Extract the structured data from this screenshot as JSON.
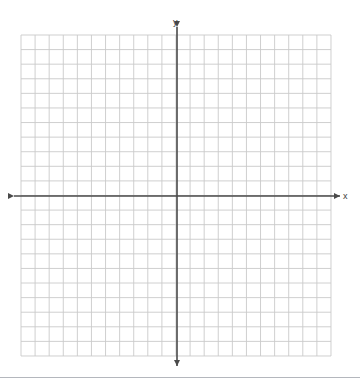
{
  "figure": {
    "title": "",
    "type": "blank-coordinate-grid"
  },
  "labels": {
    "y_axis": "y",
    "x_axis": "x"
  },
  "colors": {
    "background": "#ffffff",
    "gridline": "#c9c9c9",
    "gridline_minor": "#dcdcdc",
    "axis": "#4a4a4a",
    "label_text": "#3c3c3c",
    "bottom_rule": "#b4b7bd"
  },
  "chart_data": {
    "type": "scatter",
    "title": "",
    "xlabel": "x",
    "ylabel": "y",
    "grid": true,
    "legend": null,
    "series": [],
    "x": [],
    "values": [],
    "xlim": [
      -11,
      11
    ],
    "ylim": [
      -11,
      11
    ],
    "x_major_step": 1,
    "y_major_step": 1,
    "x_cells": 22,
    "y_cells": 22,
    "origin_cell_x": 11,
    "origin_cell_y": 11,
    "tick_labels_shown": false,
    "axis_arrows": [
      "left",
      "right",
      "up",
      "down"
    ]
  },
  "geometry": {
    "grid_left": 21,
    "grid_top": 35,
    "grid_right": 331,
    "grid_bottom": 356,
    "cell_width": 14.09,
    "cell_height": 14.59,
    "origin_x": 177,
    "origin_y": 196,
    "x_axis_start": 14,
    "x_axis_end": 340,
    "y_axis_start": 27,
    "y_axis_end": 366
  }
}
